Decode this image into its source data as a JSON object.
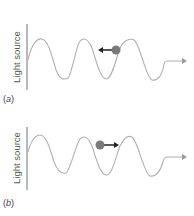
{
  "panels": [
    {
      "id": "a",
      "label_open": "(",
      "label_letter": "a",
      "label_close": ")",
      "source_label": "Light source",
      "particle_direction": "left"
    },
    {
      "id": "b",
      "label_open": "(",
      "label_letter": "b",
      "label_close": ")",
      "source_label": "Light source",
      "particle_direction": "right"
    }
  ],
  "colors": {
    "wave": "#b0b0b0",
    "source_bar": "#8a8a8a",
    "particle": "#7a7a7a",
    "arrow": "#222222",
    "text": "#555555"
  }
}
